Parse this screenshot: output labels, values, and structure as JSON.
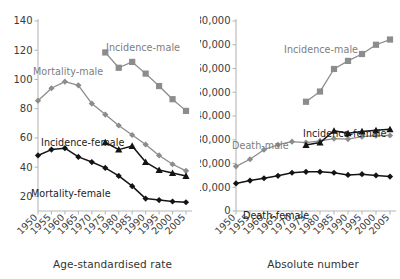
{
  "figure": {
    "panels": [
      {
        "id": "left",
        "xlabel": "Age-standardised rate",
        "ylabel": ""
      },
      {
        "id": "right",
        "xlabel": "Absolute number",
        "ylabel": ""
      }
    ]
  },
  "series_labels": {
    "left_mortality_male": "Mortality-male",
    "left_incidence_male": "Incidence-male",
    "left_incidence_female": "Incidence-female",
    "left_mortality_female": "Mortality-female",
    "right_incidence_male": "Incidence-male",
    "right_death_male": "Death-male",
    "right_incidence_female": "Incidence-female",
    "right_death_female": "Death-female"
  },
  "colors": {
    "gray_series": "#8c8c8c",
    "black_series": "#141414",
    "axis": "#b8b8b8",
    "text": "#3b3b3b"
  },
  "chart_data": [
    {
      "type": "line",
      "title": "",
      "xlabel": "Age-standardised rate",
      "ylabel": "",
      "x": [
        1950,
        1955,
        1960,
        1965,
        1970,
        1975,
        1980,
        1985,
        1990,
        1995,
        2000,
        2005
      ],
      "xtick_labels": [
        "1950",
        "1955",
        "1960",
        "1965",
        "1970",
        "1975",
        "1980",
        "1985",
        "1990",
        "1995",
        "2000",
        "2005"
      ],
      "ylim": [
        10,
        140
      ],
      "yticks": [
        20,
        40,
        60,
        80,
        100,
        120,
        140
      ],
      "ytick_labels": [
        "20",
        "40",
        "60",
        "80",
        "100",
        "120",
        "140"
      ],
      "grid": false,
      "legend": "inline-annotations",
      "series": [
        {
          "name": "Mortality-male",
          "marker": "diamond",
          "color": "#8c8c8c",
          "x": [
            1950,
            1955,
            1960,
            1965,
            1970,
            1975,
            1980,
            1985,
            1990,
            1995,
            2000,
            2005
          ],
          "values": [
            85.5,
            94,
            98.5,
            96,
            83.5,
            76,
            68.5,
            62,
            55.5,
            48,
            42,
            37.5
          ]
        },
        {
          "name": "Incidence-male",
          "marker": "square",
          "color": "#8c8c8c",
          "x": [
            1975,
            1980,
            1985,
            1990,
            1995,
            2000,
            2005
          ],
          "values": [
            118.5,
            108,
            112,
            104,
            95.5,
            86.5,
            78.5
          ]
        },
        {
          "name": "Mortality-female",
          "marker": "diamond",
          "color": "#141414",
          "x": [
            1950,
            1955,
            1960,
            1965,
            1970,
            1975,
            1980,
            1985,
            1990,
            1995,
            2000,
            2005
          ],
          "values": [
            48,
            52,
            53,
            47,
            43.5,
            39.5,
            34,
            27,
            18.5,
            17.5,
            16.5,
            16
          ]
        },
        {
          "name": "Incidence-female",
          "marker": "triangle",
          "color": "#141414",
          "x": [
            1975,
            1980,
            1985,
            1990,
            1995,
            2000,
            2005
          ],
          "values": [
            57,
            52,
            54.5,
            43.5,
            38,
            36,
            34
          ]
        }
      ]
    },
    {
      "type": "line",
      "title": "",
      "xlabel": "Absolute number",
      "ylabel": "",
      "x": [
        1950,
        1955,
        1960,
        1965,
        1970,
        1975,
        1980,
        1985,
        1990,
        1995,
        2000,
        2005
      ],
      "xtick_labels": [
        "1950",
        "1955",
        "1960",
        "1965",
        "1970",
        "1975",
        "1980",
        "1985",
        "1990",
        "1995",
        "2000",
        "2005"
      ],
      "ylim": [
        0,
        80000
      ],
      "yticks": [
        0,
        10000,
        20000,
        30000,
        40000,
        50000,
        60000,
        70000,
        80000
      ],
      "ytick_labels": [
        "0",
        "10,000",
        "20,000",
        "30,000",
        "40,000",
        "50,000",
        "60,000",
        "70,000",
        "80,000"
      ],
      "grid": false,
      "legend": "inline-annotations",
      "series": [
        {
          "name": "Death-male",
          "marker": "diamond",
          "color": "#8c8c8c",
          "x": [
            1950,
            1955,
            1960,
            1965,
            1970,
            1975,
            1980,
            1985,
            1990,
            1995,
            2000,
            2005
          ],
          "values": [
            18800,
            21800,
            25800,
            27900,
            29200,
            28800,
            29500,
            30500,
            30300,
            31300,
            31700,
            31800
          ]
        },
        {
          "name": "Incidence-male",
          "marker": "square",
          "color": "#8c8c8c",
          "x": [
            1975,
            1980,
            1985,
            1990,
            1995,
            2000,
            2005
          ],
          "values": [
            46000,
            50300,
            59800,
            63200,
            66100,
            70000,
            72200
          ]
        },
        {
          "name": "Death-female",
          "marker": "diamond",
          "color": "#141414",
          "x": [
            1950,
            1955,
            1960,
            1965,
            1970,
            1975,
            1980,
            1985,
            1990,
            1995,
            2000,
            2005
          ],
          "values": [
            11600,
            12800,
            13800,
            14800,
            16100,
            16500,
            16500,
            16100,
            15200,
            15500,
            15000,
            14500
          ]
        },
        {
          "name": "Incidence-female",
          "marker": "triangle",
          "color": "#141414",
          "x": [
            1975,
            1980,
            1985,
            1990,
            1995,
            2000,
            2005
          ],
          "values": [
            27800,
            28800,
            33800,
            32700,
            33500,
            34000,
            34400
          ]
        }
      ]
    }
  ]
}
